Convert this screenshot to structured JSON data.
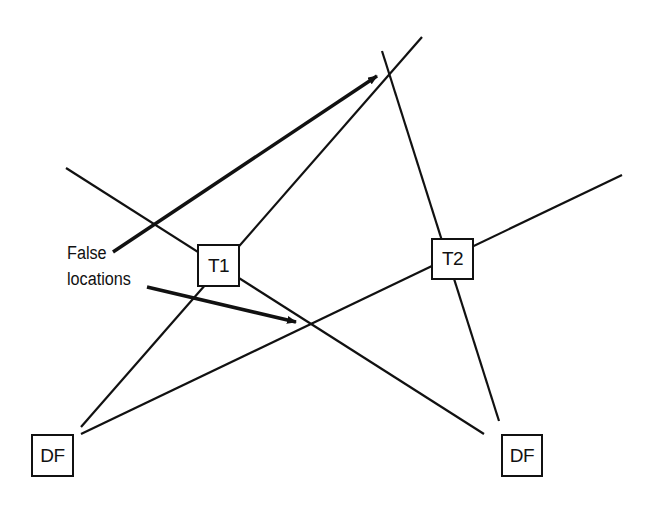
{
  "diagram": {
    "title": "",
    "nodes": [
      {
        "id": "T1",
        "label": "T1",
        "x": 197,
        "y": 244,
        "w": 43,
        "h": 43
      },
      {
        "id": "T2",
        "label": "T2",
        "x": 431,
        "y": 238,
        "w": 43,
        "h": 42
      },
      {
        "id": "DF_left",
        "label": "DF",
        "x": 31,
        "y": 434,
        "w": 43,
        "h": 43
      },
      {
        "id": "DF_right",
        "label": "DF",
        "x": 501,
        "y": 434,
        "w": 42,
        "h": 43
      }
    ],
    "annotation": {
      "line1": "False",
      "line2": "locations"
    },
    "bearing_lines": [
      {
        "from": "DF_left",
        "through": "T1",
        "x1": 81,
        "y1": 427,
        "x2": 422,
        "y2": 37
      },
      {
        "from": "DF_left",
        "through": "T2",
        "x1": 81,
        "y1": 434,
        "x2": 622,
        "y2": 175
      },
      {
        "from": "DF_right",
        "through": "T1",
        "x1": 484,
        "y1": 434,
        "x2": 66,
        "y2": 168
      },
      {
        "from": "DF_right",
        "through": "T2",
        "x1": 499,
        "y1": 421,
        "x2": 382,
        "y2": 51
      }
    ],
    "arrows": [
      {
        "name": "false-location-arrow-upper",
        "x1": 113,
        "y1": 252,
        "x2": 377,
        "y2": 76
      },
      {
        "name": "false-location-arrow-lower",
        "x1": 147,
        "y1": 287,
        "x2": 296,
        "y2": 322
      }
    ],
    "colors": {
      "line": "#111111",
      "background": "#ffffff"
    }
  }
}
